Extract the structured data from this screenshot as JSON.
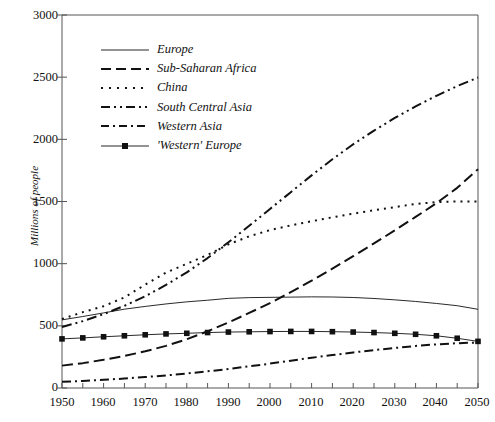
{
  "chart_data": {
    "type": "line",
    "title": "",
    "xlabel": "",
    "ylabel": "Millions of people",
    "xlim": [
      1950,
      2050
    ],
    "ylim": [
      0,
      3000
    ],
    "grid": false,
    "legend_position": "top-left-inside",
    "x_ticks": [
      1950,
      1960,
      1970,
      1980,
      1990,
      2000,
      2010,
      2020,
      2030,
      2040,
      2050
    ],
    "x_minor_tick_interval": 5,
    "y_ticks": [
      0,
      500,
      1000,
      1500,
      2000,
      2500,
      3000
    ],
    "x": [
      1950,
      1955,
      1960,
      1965,
      1970,
      1975,
      1980,
      1985,
      1990,
      1995,
      2000,
      2005,
      2010,
      2015,
      2020,
      2025,
      2030,
      2035,
      2040,
      2045,
      2050
    ],
    "series": [
      {
        "name": "Europe",
        "style": "solid",
        "values": [
          548,
          575,
          604,
          634,
          656,
          676,
          693,
          706,
          721,
          727,
          729,
          731,
          733,
          732,
          728,
          720,
          709,
          696,
          680,
          662,
          633
        ]
      },
      {
        "name": "Sub-Saharan Africa",
        "style": "dashed",
        "values": [
          180,
          200,
          227,
          258,
          295,
          339,
          392,
          456,
          527,
          604,
          682,
          771,
          863,
          960,
          1060,
          1163,
          1268,
          1376,
          1486,
          1610,
          1760
        ]
      },
      {
        "name": "China",
        "style": "dotted",
        "values": [
          555,
          610,
          658,
          729,
          831,
          928,
          999,
          1070,
          1155,
          1220,
          1270,
          1308,
          1341,
          1373,
          1402,
          1430,
          1455,
          1480,
          1495,
          1500,
          1500
        ]
      },
      {
        "name": "South Central Asia",
        "style": "dash-dot-dot",
        "values": [
          490,
          538,
          594,
          661,
          738,
          829,
          930,
          1045,
          1172,
          1305,
          1440,
          1575,
          1710,
          1840,
          1960,
          2070,
          2172,
          2265,
          2350,
          2428,
          2497
        ]
      },
      {
        "name": "Western Asia",
        "style": "dash-dot",
        "values": [
          50,
          57,
          66,
          76,
          88,
          101,
          117,
          134,
          153,
          174,
          196,
          220,
          243,
          265,
          286,
          305,
          322,
          338,
          351,
          360,
          366
        ]
      },
      {
        "name": "'Western' Europe",
        "style": "solid-square-markers",
        "values": [
          395,
          403,
          412,
          420,
          428,
          435,
          440,
          446,
          450,
          452,
          454,
          455,
          455,
          453,
          450,
          446,
          440,
          432,
          420,
          400,
          375
        ]
      }
    ]
  },
  "axes": {
    "y_title": "Millions of people",
    "y_tick_labels": [
      "3000",
      "2500",
      "2000",
      "1500",
      "1000",
      "500",
      "0"
    ],
    "x_tick_labels": [
      "1950",
      "1960",
      "1970",
      "1980",
      "1990",
      "2000",
      "2010",
      "2020",
      "2030",
      "2040",
      "2050"
    ]
  },
  "legend": {
    "items": [
      {
        "label": "Europe",
        "key": "line-solid-thin"
      },
      {
        "label": "Sub-Saharan Africa",
        "key": "line-dashed"
      },
      {
        "label": "China",
        "key": "line-dotted"
      },
      {
        "label": "South Central Asia",
        "key": "line-dash-dot-dot"
      },
      {
        "label": "Western Asia",
        "key": "line-dash-dot"
      },
      {
        "label": "'Western' Europe",
        "key": "line-solid-square-marker"
      }
    ]
  },
  "colors": {
    "line": "#111111",
    "axis": "#555555",
    "background": "#ffffff"
  }
}
